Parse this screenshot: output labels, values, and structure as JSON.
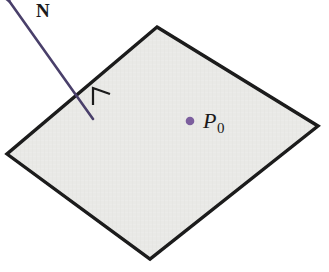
{
  "figure": {
    "background_color": "#ffffff",
    "labels": {
      "normal_vector": "N",
      "point_letter": "P",
      "point_subscript": "0"
    },
    "colors": {
      "plane_fill": "#e7e7e4",
      "plane_edge": "#1a1a1a",
      "vector_stroke": "#4a3f6b",
      "point_dot": "#7b5f9e",
      "right_angle_mark": "#1a1a1a",
      "label_text": "#1a1a1a"
    },
    "geometry": {
      "plane_corners": [
        {
          "name": "top",
          "x": 157,
          "y": 27
        },
        {
          "name": "right",
          "x": 318,
          "y": 126
        },
        {
          "name": "bottom",
          "x": 150,
          "y": 259
        },
        {
          "name": "left",
          "x": 7,
          "y": 154
        }
      ],
      "plane_edge_width": 3.4,
      "normal_vector": {
        "tail_x": 93,
        "tail_y": 119,
        "tip_x": 12,
        "tip_y": 5,
        "stroke_width": 2.6,
        "arrowhead_length": 15,
        "arrowhead_width": 9
      },
      "right_angle_mark": {
        "points": "93,105 93,88 110,94",
        "stroke_width": 2.2
      },
      "point_p0": {
        "cx": 190,
        "cy": 121,
        "r": 4.3
      }
    }
  }
}
